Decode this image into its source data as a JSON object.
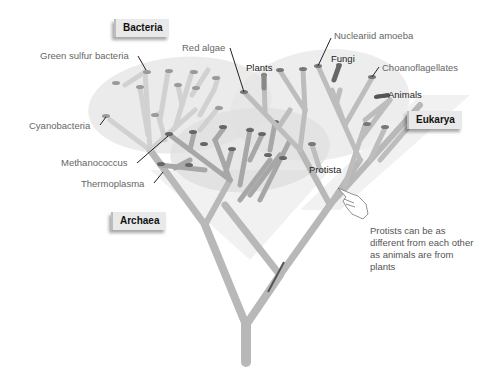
{
  "diagram": {
    "domains": [
      {
        "id": "bacteria",
        "label": "Bacteria"
      },
      {
        "id": "eukarya",
        "label": "Eukarya"
      },
      {
        "id": "archaea",
        "label": "Archaea"
      }
    ],
    "taxa_labels": {
      "green_sulfur_bacteria": "Green sulfur bacteria",
      "cyanobacteria": "Cyanobacteria",
      "methanococcus": "Methanococcus",
      "thermoplasma": "Thermoplasma",
      "red_algae": "Red algae",
      "plants": "Plants",
      "nucleariid_amoeba": "Nucleariid amoeba",
      "fungi": "Fungi",
      "choanoflagellates": "Choanoflagellates",
      "animals": "Animals",
      "protista": "Protista"
    },
    "note": "Protists can be as different from each other as animals are from plants",
    "colors": {
      "branch": "#c9c9c9",
      "branch_dark": "#8a8a8a",
      "region": "#e6e6e6",
      "label_text": "#666666",
      "label_box": "#e9e9e9"
    }
  }
}
